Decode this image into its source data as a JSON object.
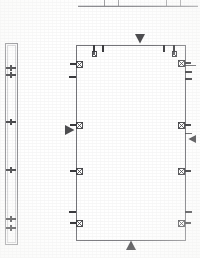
{
  "drawing": {
    "title": "Architectural Floor Plan Fragment",
    "sheet_background": "#ffffff",
    "line_color": "#6d6d72",
    "symbol_color": "#3a3a3d",
    "faint_color": "#b9b9bd",
    "scan_artifact_color": "#c9c9cc"
  },
  "top_table": {
    "name": "cut-off-title-block",
    "description": "Bottom edge of a title block table cropped at the top of the sheet",
    "x": 78,
    "y": 0,
    "width": 120,
    "height": 7,
    "column_divider_x": [
      104,
      118,
      166,
      180
    ],
    "visible_rule_y": 6
  },
  "wall_section": {
    "name": "left-wall-section-detail",
    "x": 5,
    "y": 43,
    "width": 12,
    "height": 201,
    "inner_inset": 2,
    "crosshairs": [
      {
        "label": "cross-1",
        "cy": 68
      },
      {
        "label": "cross-2",
        "cy": 75
      },
      {
        "label": "cross-3",
        "cy": 122
      },
      {
        "label": "cross-4",
        "cy": 170
      },
      {
        "label": "cross-5",
        "cy": 219
      },
      {
        "label": "cross-6",
        "cy": 228
      }
    ],
    "cross_arm": 5
  },
  "room": {
    "name": "main-room-outline",
    "x": 76,
    "y": 45,
    "width": 109,
    "height": 195,
    "stroke_width": 1
  },
  "direction_markers": [
    {
      "name": "north-arrow-marker",
      "glyph": "triangle-down",
      "x": 140,
      "y": 39,
      "size": 5
    },
    {
      "name": "south-arrow-marker",
      "glyph": "triangle-up",
      "x": 131,
      "y": 245,
      "size": 5
    },
    {
      "name": "west-arrow-marker",
      "glyph": "triangle-right",
      "x": 70,
      "y": 130,
      "size": 5
    },
    {
      "name": "east-arrow-marker",
      "glyph": "triangle-left",
      "x": 192,
      "y": 139,
      "size": 4
    }
  ],
  "top_wall_fixtures": [
    {
      "name": "fixture-top-1",
      "type": "tick",
      "x": 93,
      "w": 2,
      "h": 7
    },
    {
      "name": "fixture-top-2",
      "type": "tick",
      "x": 102,
      "w": 2,
      "h": 7
    },
    {
      "name": "fixture-top-3",
      "type": "tick",
      "x": 163,
      "w": 2,
      "h": 7
    },
    {
      "name": "fixture-top-4",
      "type": "tick",
      "x": 173,
      "w": 2,
      "h": 7
    }
  ],
  "top_wall_boxes": [
    {
      "name": "outlet-box-top-left",
      "x": 92,
      "y": 51,
      "w": 4,
      "h": 5
    },
    {
      "name": "outlet-box-top-right",
      "x": 172,
      "y": 51,
      "w": 4,
      "h": 5
    }
  ],
  "left_wall_fixtures": [
    {
      "name": "outlet-left-1",
      "y": 63,
      "bar_w": 6,
      "box_w": 6,
      "box_h": 6,
      "crossed": true
    },
    {
      "name": "outlet-left-2",
      "y": 76,
      "bar_w": 7,
      "box_w": 0,
      "box_h": 0,
      "crossed": false
    },
    {
      "name": "outlet-left-3",
      "y": 124,
      "bar_w": 6,
      "box_w": 6,
      "box_h": 6,
      "crossed": true
    },
    {
      "name": "outlet-left-4",
      "y": 170,
      "bar_w": 6,
      "box_w": 6,
      "box_h": 6,
      "crossed": true
    },
    {
      "name": "outlet-left-5",
      "y": 211,
      "bar_w": 7,
      "box_w": 0,
      "box_h": 0,
      "crossed": false
    },
    {
      "name": "outlet-left-6",
      "y": 222,
      "bar_w": 6,
      "box_w": 6,
      "box_h": 6,
      "crossed": true
    }
  ],
  "right_wall_fixtures": [
    {
      "name": "outlet-right-1",
      "y": 62,
      "bar_w": 6,
      "box_w": 6,
      "box_h": 6,
      "crossed": true
    },
    {
      "name": "outlet-right-2",
      "y": 71,
      "bar_w": 7,
      "box_w": 0,
      "box_h": 0,
      "crossed": false
    },
    {
      "name": "outlet-right-3",
      "y": 78,
      "bar_w": 7,
      "box_w": 0,
      "box_h": 0,
      "crossed": false
    },
    {
      "name": "outlet-right-4",
      "y": 124,
      "bar_w": 6,
      "box_w": 6,
      "box_h": 6,
      "crossed": true
    },
    {
      "name": "outlet-right-5",
      "y": 170,
      "bar_w": 6,
      "box_w": 6,
      "box_h": 6,
      "crossed": true
    },
    {
      "name": "outlet-right-6",
      "y": 211,
      "bar_w": 7,
      "box_w": 0,
      "box_h": 0,
      "crossed": false
    },
    {
      "name": "outlet-right-7",
      "y": 222,
      "bar_w": 6,
      "box_w": 6,
      "box_h": 6,
      "crossed": true
    }
  ],
  "right_lead_lines": [
    {
      "name": "lead-line-right-1",
      "x1": 185,
      "y1": 65,
      "x2": 196,
      "y2": 65
    },
    {
      "name": "lead-line-right-2",
      "x1": 185,
      "y1": 133,
      "x2": 192,
      "y2": 133
    }
  ]
}
